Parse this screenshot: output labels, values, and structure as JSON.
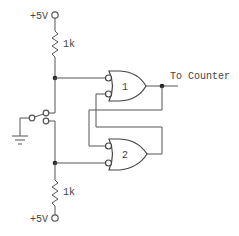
{
  "diagram": {
    "labels": {
      "supply_top": "+5V",
      "supply_bottom": "+5V",
      "resistor_top": "1k",
      "resistor_bottom": "1k",
      "gate1": "1",
      "gate2": "2",
      "output": "To Counter"
    },
    "components": [
      {
        "id": "supply-top",
        "type": "terminal",
        "label": "+5V"
      },
      {
        "id": "r-top",
        "type": "resistor",
        "value": "1k"
      },
      {
        "id": "switch",
        "type": "SPDT switch"
      },
      {
        "id": "ground",
        "type": "ground"
      },
      {
        "id": "r-bottom",
        "type": "resistor",
        "value": "1k"
      },
      {
        "id": "supply-bottom",
        "type": "terminal",
        "label": "+5V"
      },
      {
        "id": "gate-1",
        "type": "gate (OR with inverted inputs)",
        "label": "1"
      },
      {
        "id": "gate-2",
        "type": "gate (OR with inverted inputs)",
        "label": "2"
      }
    ],
    "colors": {
      "line": "#555555",
      "text": "#444444",
      "junction": "#222222",
      "background": "#ffffff"
    }
  }
}
